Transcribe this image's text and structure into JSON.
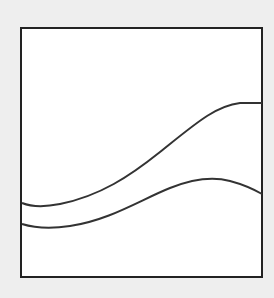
{
  "figure": {
    "background_color": "#eeeeee",
    "frame": {
      "x": 21,
      "y": 28,
      "width": 241,
      "height": 249,
      "stroke": "#222222",
      "stroke_width": 2,
      "fill": "#ffffff"
    },
    "curves": [
      {
        "name": "upper-curve",
        "stroke": "#333333",
        "stroke_width": 2,
        "path": "M22,203 C32,207 45,207 60,204 C100,196 130,176 160,152 C195,124 215,106 240,103 L262,103"
      },
      {
        "name": "lower-curve",
        "stroke": "#333333",
        "stroke_width": 2,
        "path": "M22,224 C35,228 50,229 70,226 C110,220 140,200 170,188 C195,178 215,177 230,181 C245,185 255,190 262,194"
      }
    ]
  }
}
